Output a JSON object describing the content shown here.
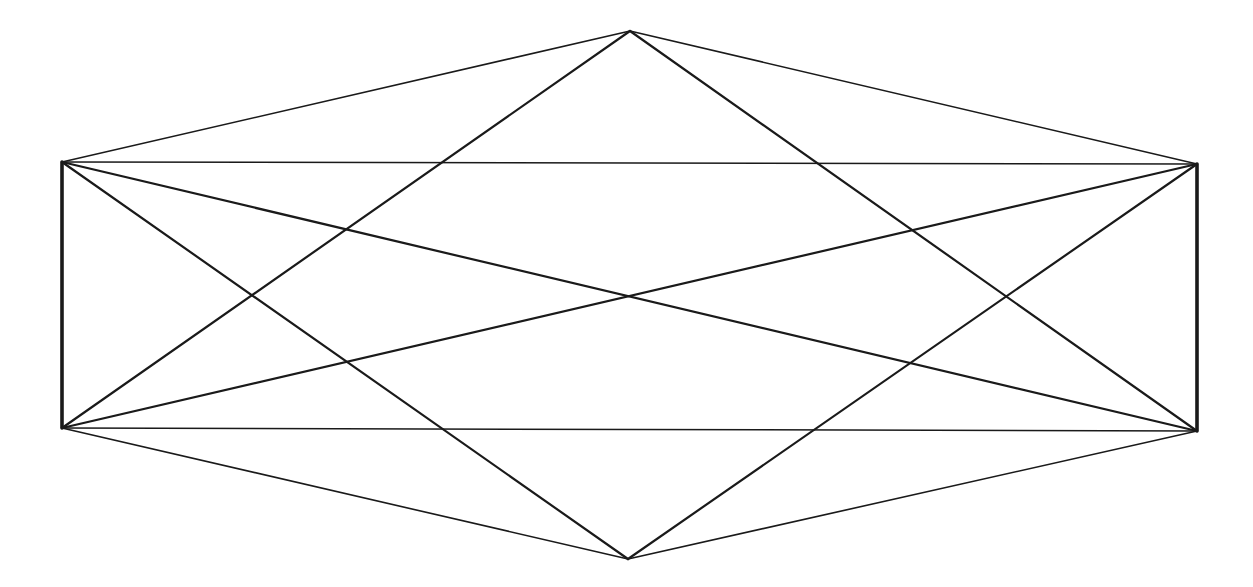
{
  "diagram": {
    "type": "line-figure",
    "background": "#ffffff",
    "stroke_color": "#1a1a1a",
    "vertices": [
      {
        "id": "T",
        "name": "top-apex",
        "x": 630,
        "y": 31
      },
      {
        "id": "TL",
        "name": "top-left-corner",
        "x": 62,
        "y": 162
      },
      {
        "id": "TR",
        "name": "top-right-corner",
        "x": 1197,
        "y": 164
      },
      {
        "id": "BL",
        "name": "bottom-left-corner",
        "x": 62,
        "y": 428
      },
      {
        "id": "BR",
        "name": "bottom-right-corner",
        "x": 1197,
        "y": 431
      },
      {
        "id": "B",
        "name": "bottom-apex",
        "x": 628,
        "y": 559
      }
    ],
    "edges": [
      {
        "name": "hexagon-edge-top-left",
        "from": "T",
        "to": "TL",
        "width": 1.6
      },
      {
        "name": "hexagon-edge-top-right",
        "from": "T",
        "to": "TR",
        "width": 1.6
      },
      {
        "name": "hexagon-edge-bottom-left",
        "from": "B",
        "to": "BL",
        "width": 1.6
      },
      {
        "name": "hexagon-edge-bottom-right",
        "from": "B",
        "to": "BR",
        "width": 1.6
      },
      {
        "name": "rectangle-edge-top",
        "from": "TL",
        "to": "TR",
        "width": 1.5
      },
      {
        "name": "rectangle-edge-bottom",
        "from": "BL",
        "to": "BR",
        "width": 1.5
      },
      {
        "name": "rectangle-edge-left",
        "from": "TL",
        "to": "BL",
        "width": 3.6
      },
      {
        "name": "rectangle-edge-right",
        "from": "TR",
        "to": "BR",
        "width": 3.6
      },
      {
        "name": "rectangle-diagonal-down",
        "from": "TL",
        "to": "BR",
        "width": 2.2
      },
      {
        "name": "rectangle-diagonal-up",
        "from": "BL",
        "to": "TR",
        "width": 2.2
      },
      {
        "name": "rhombus-edge-top-left",
        "from": "T",
        "to": "BL",
        "width": 2.2
      },
      {
        "name": "rhombus-edge-top-right",
        "from": "T",
        "to": "BR",
        "width": 2.2
      },
      {
        "name": "rhombus-edge-bottom-left",
        "from": "B",
        "to": "TL",
        "width": 2.2
      },
      {
        "name": "rhombus-edge-bottom-right",
        "from": "B",
        "to": "TR",
        "width": 2.2
      }
    ],
    "labels": []
  }
}
